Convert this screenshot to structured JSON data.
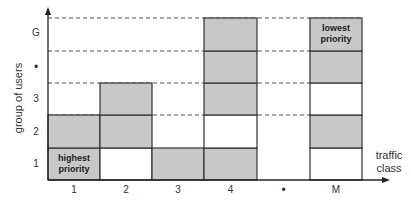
{
  "diagram": {
    "y_axis_label": "group of users",
    "x_axis_label_line1": "traffic",
    "x_axis_label_line2": "class",
    "y_ticks": [
      "1",
      "2",
      "3",
      "•",
      "G"
    ],
    "x_ticks": [
      "1",
      "2",
      "3",
      "4",
      "•",
      "M"
    ],
    "highest_label_line1": "highest",
    "highest_label_line2": "priority",
    "lowest_label_line1": "lowest",
    "lowest_label_line2": "priority",
    "colors": {
      "shaded": "#c8c8c8",
      "line": "#333333",
      "background": "#ffffff"
    },
    "grid": {
      "columns": [
        {
          "class": "1",
          "cells": [
            "shaded",
            "shaded",
            "none",
            "none",
            "none"
          ]
        },
        {
          "class": "2",
          "cells": [
            "white",
            "shaded",
            "shaded",
            "none",
            "none"
          ]
        },
        {
          "class": "3",
          "cells": [
            "shaded",
            "none",
            "none",
            "none",
            "none"
          ]
        },
        {
          "class": "4",
          "cells": [
            "shaded",
            "white",
            "shaded",
            "shaded",
            "shaded"
          ]
        },
        {
          "class": "•",
          "cells": [
            "none",
            "none",
            "none",
            "none",
            "none"
          ]
        },
        {
          "class": "M",
          "cells": [
            "white",
            "shaded",
            "white",
            "shaded",
            "shaded"
          ]
        }
      ]
    }
  }
}
